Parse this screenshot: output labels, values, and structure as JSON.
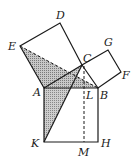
{
  "figure": {
    "stroke_color": "#1a1a1a",
    "hatch_color": "#8a8a8a",
    "points": {
      "A": [
        44,
        88
      ],
      "B": [
        98,
        88
      ],
      "C": [
        82,
        65
      ],
      "D": [
        60,
        23
      ],
      "E": [
        20,
        46
      ],
      "G": [
        108,
        50
      ],
      "F": [
        121,
        72
      ],
      "K": [
        44,
        142
      ],
      "H": [
        98,
        142
      ],
      "L": [
        84,
        88
      ],
      "M": [
        84,
        142
      ]
    },
    "labels": {
      "A": "A",
      "B": "B",
      "C": "C",
      "D": "D",
      "E": "E",
      "F": "F",
      "G": "G",
      "H": "H",
      "K": "K",
      "L": "L",
      "M": "M"
    },
    "shaded_triangles": [
      "EAB",
      "KAC"
    ],
    "dashed_segments": [
      "EB",
      "CL",
      "LM"
    ]
  }
}
